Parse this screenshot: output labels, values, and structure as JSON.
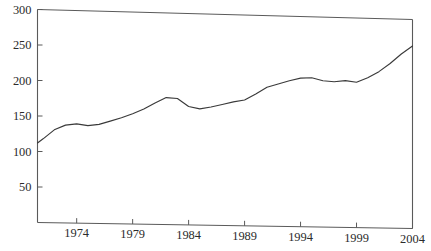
{
  "chart_data": {
    "type": "line",
    "title": "",
    "subtitle": "",
    "xlabel": "",
    "ylabel": "",
    "grid": false,
    "legend": false,
    "legend_position": "none",
    "xlim": [
      1970.5,
      2004
    ],
    "ylim": [
      0,
      300
    ],
    "x_ticks": [
      1974,
      1979,
      1984,
      1989,
      1994,
      1999,
      2004
    ],
    "x_tick_labels": [
      "1974",
      "1979",
      "1984",
      "1989",
      "1994",
      "1999",
      "2004"
    ],
    "y_ticks": [
      50,
      100,
      150,
      200,
      250,
      300
    ],
    "y_tick_labels": [
      "50",
      "100",
      "150",
      "200",
      "250",
      "300"
    ],
    "series": [
      {
        "name": "series-1",
        "color": "#3a3a3a",
        "x": [
          1970.5,
          1971,
          1972,
          1973,
          1974,
          1975,
          1976,
          1977,
          1978,
          1979,
          1980,
          1981,
          1982,
          1983,
          1984,
          1985,
          1986,
          1987,
          1988,
          1989,
          1990,
          1991,
          1992,
          1993,
          1994,
          1995,
          1996,
          1997,
          1998,
          1999,
          2000,
          2001,
          2002,
          2003,
          2004
        ],
        "values": [
          112,
          118,
          131,
          138,
          140,
          138,
          140,
          145,
          150,
          156,
          163,
          172,
          180,
          179,
          168,
          165,
          168,
          172,
          176,
          179,
          188,
          198,
          203,
          208,
          212,
          213,
          209,
          208,
          210,
          208,
          215,
          224,
          236,
          250,
          262
        ]
      }
    ],
    "annotations": []
  },
  "axes": {
    "frame_color": "#5a5a5a",
    "background": "#ffffff",
    "line_color": "#3a3a3a"
  }
}
